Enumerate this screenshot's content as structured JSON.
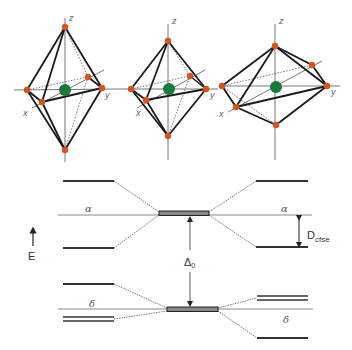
{
  "figure": {
    "colors": {
      "metal_atom": "#1a7a3a",
      "ligand_atom": "#d9531e",
      "edge": "#1a1a1a",
      "axis": "#777777",
      "level": "#333333",
      "level_fill": "#888888"
    }
  },
  "octahedra": [
    {
      "name": "elongated",
      "axis_labels": {
        "x": "x",
        "y": "y",
        "z": "z"
      }
    },
    {
      "name": "regular",
      "axis_labels": {
        "x": "x",
        "y": "y",
        "z": "z"
      }
    },
    {
      "name": "compressed",
      "axis_labels": {
        "x": "x",
        "y": "y",
        "z": "z"
      }
    }
  ],
  "energy_diagram": {
    "energy_axis_label": "E",
    "upper_set_label_left": "α",
    "upper_set_label_right": "α",
    "lower_set_label_left": "δ",
    "lower_set_label_right": "δ",
    "splitting_label": "Δ",
    "splitting_subscript": "0",
    "cfse_label": "D",
    "cfse_subscript": "cfse"
  }
}
